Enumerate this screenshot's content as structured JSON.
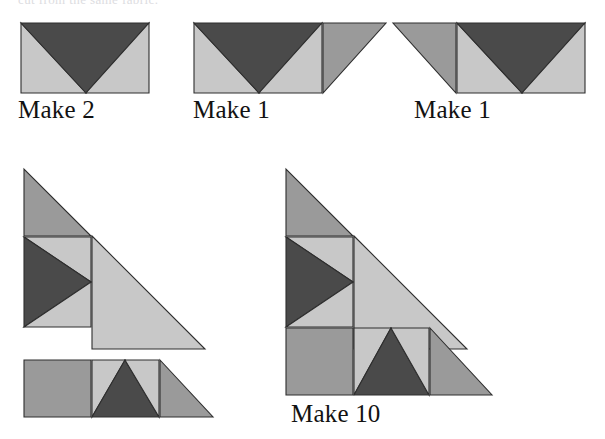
{
  "page": {
    "background_color": "#ffffff",
    "width": 605,
    "height": 439,
    "cropped_heading_text": "cut from the same fabric."
  },
  "palette": {
    "dark": "#4a4a4a",
    "medium": "#9a9a9a",
    "light": "#c8c8c8",
    "outline": "#2e2e2e",
    "background": "#ffffff",
    "label_color": "#121212"
  },
  "units": [
    {
      "id": "unit-flying-geese-plain",
      "name": "flying-geese-unit",
      "label": "Make 2",
      "label_x": 18,
      "label_y": 96,
      "svg_x": 20,
      "svg_y": 22,
      "svg_w": 130,
      "svg_h": 72,
      "patches": [
        {
          "name": "geese-left-light-triangle",
          "fill": "light",
          "points": "1,1 1,71 66,71"
        },
        {
          "name": "geese-center-dark-triangle",
          "fill": "dark",
          "points": "1,1 129,1 66,71"
        },
        {
          "name": "geese-right-light-triangle",
          "fill": "light",
          "points": "129,1 129,71 66,71"
        }
      ]
    },
    {
      "id": "unit-flying-geese-right-corner",
      "name": "flying-geese-with-right-corner-unit",
      "label": "Make 1",
      "label_x": 193,
      "label_y": 96,
      "svg_x": 193,
      "svg_y": 22,
      "svg_w": 194,
      "svg_h": 72,
      "patches": [
        {
          "name": "geese-left-light-triangle",
          "fill": "light",
          "points": "1,1 1,71 66,71"
        },
        {
          "name": "geese-center-dark-triangle",
          "fill": "dark",
          "points": "1,1 129,1 66,71"
        },
        {
          "name": "geese-right-light-triangle",
          "fill": "light",
          "points": "129,1 129,71 66,71"
        },
        {
          "name": "corner-medium-triangle",
          "fill": "medium",
          "points": "130,1 193,1 130,71"
        }
      ]
    },
    {
      "id": "unit-flying-geese-left-corner",
      "name": "flying-geese-with-left-corner-unit",
      "label": "Make 1",
      "label_x": 414,
      "label_y": 96,
      "svg_x": 392,
      "svg_y": 22,
      "svg_w": 194,
      "svg_h": 72,
      "patches": [
        {
          "name": "corner-medium-triangle",
          "fill": "medium",
          "points": "1,1 64,1 64,71"
        },
        {
          "name": "geese-left-light-triangle",
          "fill": "light",
          "points": "65,1 65,71 130,71"
        },
        {
          "name": "geese-center-dark-triangle",
          "fill": "dark",
          "points": "65,1 193,1 130,71"
        },
        {
          "name": "geese-right-light-triangle",
          "fill": "light",
          "points": "193,1 193,71 130,71"
        }
      ]
    },
    {
      "id": "unit-half-block-exploded",
      "name": "half-block-exploded-unit",
      "label": "",
      "label_x": 0,
      "label_y": 0,
      "svg_x": 23,
      "svg_y": 168,
      "svg_w": 190,
      "svg_h": 250,
      "patches": [
        {
          "name": "top-corner-medium-triangle",
          "fill": "medium",
          "points": "1,1 1,68 68,68"
        },
        {
          "name": "geese-upper-light-triangle",
          "fill": "light",
          "points": "1,69 68,69 68,114"
        },
        {
          "name": "geese-dark-triangle",
          "fill": "dark",
          "points": "1,69 68,114 1,159"
        },
        {
          "name": "geese-lower-light-triangle",
          "fill": "light",
          "points": "1,159 68,114 68,159"
        },
        {
          "name": "large-light-triangle",
          "fill": "light",
          "points": "69,68 182,181 69,181"
        },
        {
          "name": "strip-left-medium-square",
          "fill": "medium",
          "points": "1,192 68,192 68,249 1,249"
        },
        {
          "name": "strip-geese-left-light-triangle",
          "fill": "light",
          "points": "69,192 69,249 102,192"
        },
        {
          "name": "strip-geese-dark-triangle",
          "fill": "dark",
          "points": "102,192 136,249 69,249"
        },
        {
          "name": "strip-geese-right-light-triangle",
          "fill": "light",
          "points": "102,192 136,192 136,249"
        },
        {
          "name": "strip-right-medium-triangle",
          "fill": "medium",
          "points": "137,192 190,249 137,249"
        }
      ]
    },
    {
      "id": "unit-half-block-joined",
      "name": "half-block-joined-unit",
      "label": "Make 10",
      "label_x": 291,
      "label_y": 400,
      "svg_x": 285,
      "svg_y": 168,
      "svg_w": 208,
      "svg_h": 228,
      "patches": [
        {
          "name": "top-corner-medium-triangle",
          "fill": "medium",
          "points": "1,1 1,68 68,68"
        },
        {
          "name": "geese-upper-light-triangle",
          "fill": "light",
          "points": "1,69 68,69 68,114"
        },
        {
          "name": "geese-dark-triangle",
          "fill": "dark",
          "points": "1,69 68,114 1,159"
        },
        {
          "name": "geese-lower-light-triangle",
          "fill": "light",
          "points": "1,159 68,114 68,159"
        },
        {
          "name": "large-light-triangle",
          "fill": "light",
          "points": "69,68 182,181 69,181"
        },
        {
          "name": "strip-left-medium-square",
          "fill": "medium",
          "points": "1,160 68,160 68,227 1,227"
        },
        {
          "name": "strip-geese-left-light-triangle",
          "fill": "light",
          "points": "69,160 69,227 106,160"
        },
        {
          "name": "strip-geese-dark-triangle",
          "fill": "dark",
          "points": "106,160 144,227 69,227"
        },
        {
          "name": "strip-geese-right-light-triangle",
          "fill": "light",
          "points": "106,160 144,160 144,227"
        },
        {
          "name": "strip-right-medium-triangle",
          "fill": "medium",
          "points": "145,160 207,227 145,227"
        }
      ]
    }
  ]
}
